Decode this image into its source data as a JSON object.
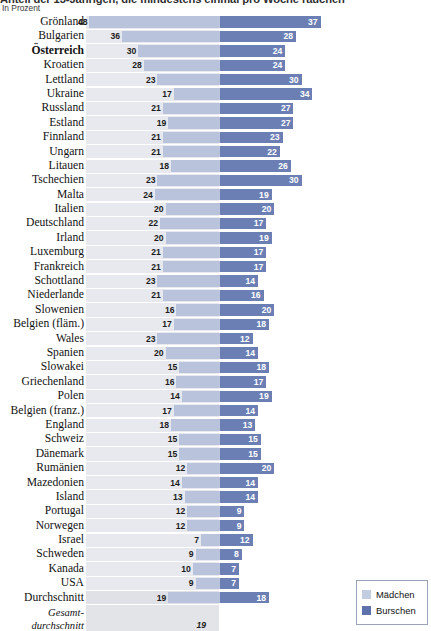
{
  "header": {
    "title": "Anteil der 13-Jährigen, die mindestens einmal pro Woche rauchen",
    "subtitle": "In Prozent"
  },
  "legend": {
    "items": [
      {
        "label": "Mädchen",
        "color": "#c3cde2"
      },
      {
        "label": "Burschen",
        "color": "#5d72ad"
      }
    ]
  },
  "chart_data": {
    "type": "bar",
    "title": "Anteil der 13-Jährigen, die mindestens einmal pro Woche rauchen",
    "subtitle": "In Prozent",
    "orientation": "horizontal-diverging",
    "xlabel": "",
    "ylabel": "",
    "unit": "Prozent",
    "grid": false,
    "legend_position": "bottom-right",
    "categories": [
      "Grönland",
      "Bulgarien",
      "Österreich",
      "Kroatien",
      "Lettland",
      "Ukraine",
      "Russland",
      "Estland",
      "Finnland",
      "Ungarn",
      "Litauen",
      "Tschechien",
      "Malta",
      "Italien",
      "Deutschland",
      "Irland",
      "Luxemburg",
      "Frankreich",
      "Schottland",
      "Niederlande",
      "Slowenien",
      "Belgien (fläm.)",
      "Wales",
      "Spanien",
      "Slowakei",
      "Griechenland",
      "Polen",
      "Belgien (franz.)",
      "England",
      "Schweiz",
      "Dänemark",
      "Rumänien",
      "Mazedonien",
      "Island",
      "Portugal",
      "Norwegen",
      "Israel",
      "Schweden",
      "Kanada",
      "USA",
      "Durchschnitt",
      "Gesamt-durchschnitt"
    ],
    "series": [
      {
        "name": "Mädchen",
        "color": "#b9c4dc",
        "side": "left",
        "values": [
          48,
          36,
          30,
          28,
          23,
          17,
          21,
          19,
          21,
          21,
          18,
          23,
          24,
          20,
          22,
          20,
          21,
          21,
          23,
          21,
          16,
          17,
          23,
          20,
          15,
          16,
          14,
          17,
          18,
          15,
          15,
          12,
          14,
          13,
          12,
          12,
          7,
          9,
          10,
          9,
          19,
          19
        ]
      },
      {
        "name": "Burschen",
        "color": "#6b7fb5",
        "side": "right",
        "values": [
          37,
          28,
          24,
          24,
          30,
          34,
          27,
          27,
          23,
          22,
          26,
          30,
          19,
          20,
          17,
          19,
          17,
          17,
          14,
          16,
          20,
          18,
          12,
          14,
          18,
          17,
          19,
          14,
          13,
          15,
          15,
          20,
          14,
          14,
          9,
          9,
          12,
          8,
          7,
          7,
          18,
          null
        ]
      }
    ],
    "rows": [
      {
        "label": "Grönland",
        "m": 48,
        "b": 37,
        "style": "normal"
      },
      {
        "label": "Bulgarien",
        "m": 36,
        "b": 28,
        "style": "normal"
      },
      {
        "label": "Österreich",
        "m": 30,
        "b": 24,
        "style": "bold"
      },
      {
        "label": "Kroatien",
        "m": 28,
        "b": 24,
        "style": "normal"
      },
      {
        "label": "Lettland",
        "m": 23,
        "b": 30,
        "style": "normal"
      },
      {
        "label": "Ukraine",
        "m": 17,
        "b": 34,
        "style": "normal"
      },
      {
        "label": "Russland",
        "m": 21,
        "b": 27,
        "style": "normal"
      },
      {
        "label": "Estland",
        "m": 19,
        "b": 27,
        "style": "normal"
      },
      {
        "label": "Finnland",
        "m": 21,
        "b": 23,
        "style": "normal"
      },
      {
        "label": "Ungarn",
        "m": 21,
        "b": 22,
        "style": "normal"
      },
      {
        "label": "Litauen",
        "m": 18,
        "b": 26,
        "style": "normal"
      },
      {
        "label": "Tschechien",
        "m": 23,
        "b": 30,
        "style": "normal"
      },
      {
        "label": "Malta",
        "m": 24,
        "b": 19,
        "style": "normal"
      },
      {
        "label": "Italien",
        "m": 20,
        "b": 20,
        "style": "normal"
      },
      {
        "label": "Deutschland",
        "m": 22,
        "b": 17,
        "style": "normal"
      },
      {
        "label": "Irland",
        "m": 20,
        "b": 19,
        "style": "normal"
      },
      {
        "label": "Luxemburg",
        "m": 21,
        "b": 17,
        "style": "normal"
      },
      {
        "label": "Frankreich",
        "m": 21,
        "b": 17,
        "style": "normal"
      },
      {
        "label": "Schottland",
        "m": 23,
        "b": 14,
        "style": "normal"
      },
      {
        "label": "Niederlande",
        "m": 21,
        "b": 16,
        "style": "normal"
      },
      {
        "label": "Slowenien",
        "m": 16,
        "b": 20,
        "style": "normal"
      },
      {
        "label": "Belgien (fläm.)",
        "m": 17,
        "b": 18,
        "style": "normal"
      },
      {
        "label": "Wales",
        "m": 23,
        "b": 12,
        "style": "normal"
      },
      {
        "label": "Spanien",
        "m": 20,
        "b": 14,
        "style": "normal"
      },
      {
        "label": "Slowakei",
        "m": 15,
        "b": 18,
        "style": "normal"
      },
      {
        "label": "Griechenland",
        "m": 16,
        "b": 17,
        "style": "normal"
      },
      {
        "label": "Polen",
        "m": 14,
        "b": 19,
        "style": "normal"
      },
      {
        "label": "Belgien (franz.)",
        "m": 17,
        "b": 14,
        "style": "normal"
      },
      {
        "label": "England",
        "m": 18,
        "b": 13,
        "style": "normal"
      },
      {
        "label": "Schweiz",
        "m": 15,
        "b": 15,
        "style": "normal"
      },
      {
        "label": "Dänemark",
        "m": 15,
        "b": 15,
        "style": "normal"
      },
      {
        "label": "Rumänien",
        "m": 12,
        "b": 20,
        "style": "normal"
      },
      {
        "label": "Mazedonien",
        "m": 14,
        "b": 14,
        "style": "normal"
      },
      {
        "label": "Island",
        "m": 13,
        "b": 14,
        "style": "normal"
      },
      {
        "label": "Portugal",
        "m": 12,
        "b": 9,
        "style": "normal"
      },
      {
        "label": "Norwegen",
        "m": 12,
        "b": 9,
        "style": "normal"
      },
      {
        "label": "Israel",
        "m": 7,
        "b": 12,
        "style": "normal"
      },
      {
        "label": "Schweden",
        "m": 9,
        "b": 8,
        "style": "normal"
      },
      {
        "label": "Kanada",
        "m": 10,
        "b": 7,
        "style": "normal"
      },
      {
        "label": "USA",
        "m": 9,
        "b": 7,
        "style": "normal"
      },
      {
        "label": "Durchschnitt",
        "m": 19,
        "b": 18,
        "style": "avg"
      },
      {
        "label": "Gesamt-\ndurchschnitt",
        "m": 19,
        "b": null,
        "style": "total"
      }
    ]
  }
}
